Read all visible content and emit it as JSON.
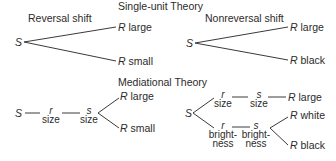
{
  "single_unit": {
    "title": "Single-unit Theory",
    "reversal": {
      "label": "Reversal shift",
      "stimulus": "S",
      "responses": [
        {
          "r": "R",
          "value": "large"
        },
        {
          "r": "R",
          "value": "small"
        }
      ]
    },
    "nonreversal": {
      "label": "Nonreversal shift",
      "stimulus": "S",
      "responses": [
        {
          "r": "R",
          "value": "large"
        },
        {
          "r": "R",
          "value": "black"
        }
      ]
    }
  },
  "mediational": {
    "title": "Mediational Theory",
    "reversal": {
      "stimulus": "S",
      "chain": [
        {
          "symbol": "r",
          "dimension": "size"
        },
        {
          "symbol": "s",
          "dimension": "size"
        }
      ],
      "responses": [
        {
          "r": "R",
          "value": "large"
        },
        {
          "r": "R",
          "value": "small"
        }
      ]
    },
    "nonreversal": {
      "stimulus": "S",
      "upper_chain": [
        {
          "symbol": "r",
          "dimension": "size"
        },
        {
          "symbol": "s",
          "dimension": "size"
        }
      ],
      "upper_response": {
        "r": "R",
        "value": "large"
      },
      "lower_chain": [
        {
          "symbol": "r",
          "dimension_line1": "bright-",
          "dimension_line2": "ness"
        },
        {
          "symbol": "s",
          "dimension_line1": "bright-",
          "dimension_line2": "ness"
        }
      ],
      "lower_responses": [
        {
          "r": "R",
          "value": "white"
        },
        {
          "r": "R",
          "value": "black"
        }
      ]
    }
  }
}
